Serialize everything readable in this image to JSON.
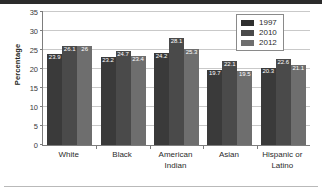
{
  "chart_data": {
    "type": "bar",
    "title": "",
    "xlabel": "",
    "ylabel": "Percentage",
    "ylim": [
      0,
      35
    ],
    "yticks": [
      0,
      5,
      10,
      15,
      20,
      25,
      30,
      35
    ],
    "grid": true,
    "legend_position": "top-right",
    "categories": [
      "White",
      "Black",
      "American Indian",
      "Asian",
      "Hispanic or Latino"
    ],
    "series": [
      {
        "name": "1997",
        "color": "#3a3a3a",
        "values": [
          23.9,
          23.2,
          24.2,
          19.7,
          20.3
        ]
      },
      {
        "name": "2010",
        "color": "#4a4a4a",
        "values": [
          26.1,
          24.7,
          28.1,
          22.1,
          22.6
        ]
      },
      {
        "name": "2012",
        "color": "#6e6e6e",
        "values": [
          26.0,
          23.4,
          25.3,
          19.5,
          21.1
        ]
      }
    ],
    "value_labels": [
      [
        "23.9",
        "26.1",
        "26"
      ],
      [
        "23.2",
        "24.7",
        "23.4"
      ],
      [
        "24.2",
        "28.1",
        "25.3"
      ],
      [
        "19.7",
        "22.1",
        "19.5"
      ],
      [
        "20.3",
        "22.6",
        "21.1"
      ]
    ],
    "category_lines": [
      [
        "White"
      ],
      [
        "Black"
      ],
      [
        "American",
        "Indian"
      ],
      [
        "Asian"
      ],
      [
        "Hispanic or",
        "Latino"
      ]
    ]
  }
}
